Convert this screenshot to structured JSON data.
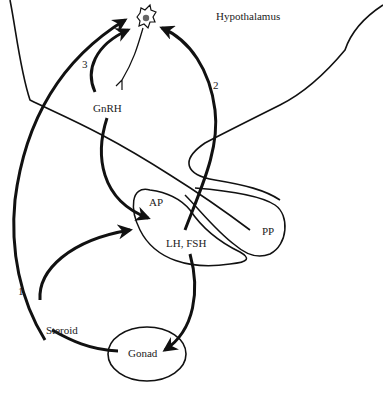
{
  "diagram": {
    "labels": {
      "hypothalamus": "Hypothalamus",
      "gnrh": "GnRH",
      "ap": "AP",
      "pp": "PP",
      "lh_fsh": "LH, FSH",
      "steroid": "Steroid",
      "gonad": "Gonad",
      "loop1": "1",
      "loop2": "2",
      "loop3": "3"
    },
    "nodes": [
      {
        "id": "neuron",
        "label": "GnRH neuron (hypothalamus)"
      },
      {
        "id": "ap",
        "label": "AP"
      },
      {
        "id": "pp",
        "label": "PP"
      },
      {
        "id": "gonad",
        "label": "Gonad"
      }
    ],
    "edges": [
      {
        "from": "neuron",
        "to": "ap",
        "label": "GnRH"
      },
      {
        "from": "ap",
        "to": "gonad",
        "label": "LH, FSH"
      },
      {
        "from": "gonad",
        "to": "ap",
        "label": "Steroid"
      },
      {
        "from": "gonad",
        "to": "neuron",
        "label": "1",
        "note": "long feedback loop"
      },
      {
        "from": "ap",
        "to": "neuron",
        "label": "2",
        "note": "short feedback loop"
      },
      {
        "from": "gnrh",
        "to": "neuron",
        "label": "3",
        "note": "ultrashort feedback loop"
      }
    ],
    "colors": {
      "stroke": "#111111",
      "background": "#ffffff"
    }
  }
}
